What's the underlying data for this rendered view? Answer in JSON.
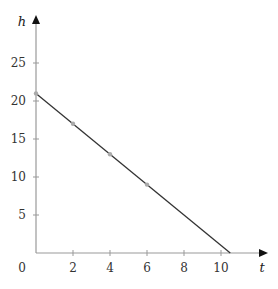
{
  "chart_data": {
    "type": "line",
    "title": "",
    "xlabel": "t",
    "ylabel": "h",
    "xlim": [
      0,
      11.5
    ],
    "ylim": [
      0,
      28
    ],
    "x_ticks": [
      2,
      4,
      6,
      8,
      10
    ],
    "y_ticks": [
      5,
      10,
      15,
      20,
      25
    ],
    "origin_label": "0",
    "grid": false,
    "legend": null,
    "series": [
      {
        "name": "h(t)",
        "line": {
          "x": [
            0,
            10.5
          ],
          "y": [
            21,
            0
          ]
        },
        "points": {
          "x": [
            0,
            2,
            4,
            6
          ],
          "y": [
            21,
            17,
            13,
            9
          ]
        }
      }
    ],
    "colors": {
      "line": "#333333",
      "axis": "#999999",
      "points": "#aaaaaa"
    }
  }
}
